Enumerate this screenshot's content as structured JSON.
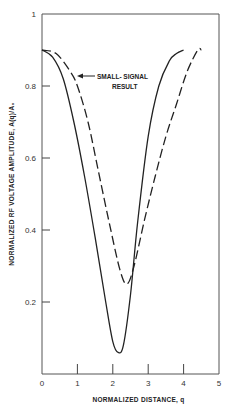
{
  "chart_data": {
    "type": "line",
    "title": "",
    "xlabel": "NORMALIZED  DISTANCE, q",
    "ylabel": "NORMALIZED  RF  VOLTAGE  AMPLITUDE, A(q)/A₀",
    "xlim": [
      0,
      5
    ],
    "ylim": [
      0,
      1
    ],
    "x_ticks": [
      "0",
      "1",
      "2",
      "3",
      "4",
      "5"
    ],
    "y_ticks": [
      "0.2",
      "0.4",
      "0.6",
      "0.8",
      "1"
    ],
    "grid": false,
    "annotations": [
      {
        "text": [
          "SMALL- SIGNAL",
          "RESULT"
        ],
        "points_to": "dashed"
      }
    ],
    "series": [
      {
        "name": "large-signal (solid)",
        "style": "solid",
        "x": [
          0,
          0.3,
          0.6,
          0.9,
          1.2,
          1.5,
          1.8,
          2.0,
          2.15,
          2.3,
          2.5,
          2.7,
          3.0,
          3.3,
          3.6,
          3.8,
          4.0
        ],
        "y": [
          0.9,
          0.88,
          0.82,
          0.7,
          0.55,
          0.38,
          0.2,
          0.09,
          0.06,
          0.08,
          0.22,
          0.42,
          0.66,
          0.8,
          0.87,
          0.89,
          0.9
        ]
      },
      {
        "name": "SMALL-SIGNAL RESULT (dashed)",
        "style": "dashed",
        "x": [
          0,
          0.4,
          0.8,
          1.0,
          1.3,
          1.6,
          1.9,
          2.2,
          2.4,
          2.6,
          2.9,
          3.2,
          3.5,
          3.8,
          4.1,
          4.4,
          4.5
        ],
        "y": [
          0.9,
          0.89,
          0.84,
          0.8,
          0.7,
          0.56,
          0.42,
          0.29,
          0.25,
          0.3,
          0.43,
          0.55,
          0.66,
          0.75,
          0.84,
          0.9,
          0.9
        ]
      }
    ]
  }
}
